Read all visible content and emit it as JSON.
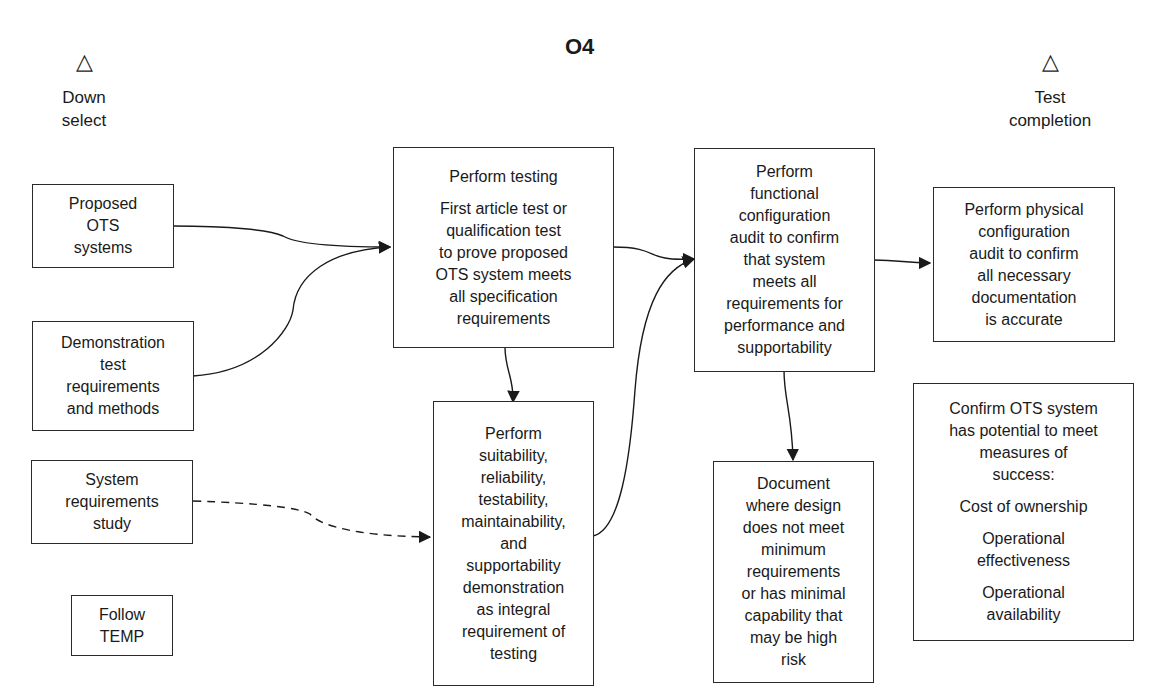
{
  "title": "O4",
  "milestones": {
    "left": {
      "icon": "triangle-milestone",
      "glyph": "△",
      "label_line1": "Down",
      "label_line2": "select"
    },
    "right": {
      "icon": "triangle-milestone",
      "glyph": "△",
      "label_line1": "Test",
      "label_line2": "completion"
    }
  },
  "boxes": {
    "proposed_ots": [
      "Proposed",
      "OTS",
      "systems"
    ],
    "demo_test_req": [
      "Demonstration",
      "test",
      "requirements",
      "and methods"
    ],
    "system_req_study": [
      "System",
      "requirements",
      "study"
    ],
    "follow_temp": [
      "Follow",
      "TEMP"
    ],
    "perform_testing": {
      "heading": "Perform testing",
      "body": [
        "First article test or",
        "qualification test",
        "to prove proposed",
        "OTS system meets",
        "all specification",
        "requirements"
      ]
    },
    "perform_suitability": [
      "Perform",
      "suitability,",
      "reliability,",
      "testability,",
      "maintainability,",
      "and",
      "supportability",
      "demonstration",
      "as integral",
      "requirement of",
      "testing"
    ],
    "functional_audit": [
      "Perform",
      "functional",
      "configuration",
      "audit to confirm",
      "that system",
      "meets all",
      "requirements for",
      "performance and",
      "supportability"
    ],
    "document_design": [
      "Document",
      "where design",
      "does not meet",
      "minimum",
      "requirements",
      "or has minimal",
      "capability that",
      "may be high",
      "risk"
    ],
    "physical_audit": [
      "Perform physical",
      "configuration",
      "audit to confirm",
      "all necessary",
      "documentation",
      "is accurate"
    ],
    "confirm_ots": {
      "heading": [
        "Confirm OTS system",
        "has potential to meet",
        "measures of",
        "success:"
      ],
      "measures": [
        [
          "Cost of ownership"
        ],
        [
          "Operational",
          "effectiveness"
        ],
        [
          "Operational",
          "availability"
        ]
      ]
    }
  },
  "connectors": [
    {
      "from": "proposed_ots",
      "to": "perform_testing",
      "style": "solid"
    },
    {
      "from": "demo_test_req",
      "to": "perform_testing",
      "style": "solid"
    },
    {
      "from": "system_req_study",
      "to": "perform_suitability",
      "style": "dashed"
    },
    {
      "from": "perform_testing",
      "to": "perform_suitability",
      "style": "solid"
    },
    {
      "from": "perform_testing",
      "to": "functional_audit",
      "style": "solid"
    },
    {
      "from": "perform_suitability",
      "to": "functional_audit",
      "style": "solid"
    },
    {
      "from": "functional_audit",
      "to": "physical_audit",
      "style": "solid"
    },
    {
      "from": "functional_audit",
      "to": "document_design",
      "style": "solid"
    }
  ],
  "colors": {
    "line": "#1a1a1a",
    "background": "#ffffff"
  }
}
